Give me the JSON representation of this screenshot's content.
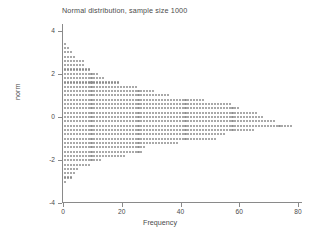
{
  "chart_data": {
    "type": "bar",
    "orientation": "horizontal",
    "style": "dot-plot",
    "title": "Normal distribution, sample size 1000",
    "xlabel": "Frequency",
    "ylabel": "norm",
    "xlim": [
      0,
      80
    ],
    "ylim": [
      -4,
      4
    ],
    "xticks": [
      0,
      20,
      40,
      60,
      80
    ],
    "xtick_labels": [
      "0",
      "20",
      "40",
      "60",
      "80"
    ],
    "yticks": [
      4,
      2,
      0,
      -2,
      -4
    ],
    "ytick_labels": [
      "4",
      "2",
      "0",
      "-2",
      "-4"
    ],
    "grid": false,
    "legend": false,
    "sample_size": 1000,
    "bin_width": 0.2,
    "dot_color": "#8c8c8c",
    "axis_color": "#8a8a8a",
    "text_color": "#4a4a4a",
    "background": "#ffffff",
    "categories": [
      3.4,
      3.2,
      3.0,
      2.8,
      2.6,
      2.4,
      2.2,
      2.0,
      1.8,
      1.6,
      1.4,
      1.2,
      1.0,
      0.8,
      0.6,
      0.4,
      0.2,
      0.0,
      -0.2,
      -0.4,
      -0.6,
      -0.8,
      -1.0,
      -1.2,
      -1.4,
      -1.6,
      -1.8,
      -2.0,
      -2.2,
      -2.4,
      -2.6,
      -2.8,
      -3.0
    ],
    "values": [
      1,
      2,
      3,
      4,
      7,
      7,
      9,
      12,
      14,
      19,
      25,
      31,
      36,
      48,
      57,
      60,
      66,
      68,
      72,
      78,
      65,
      55,
      52,
      39,
      28,
      27,
      21,
      13,
      9,
      5,
      4,
      3,
      1
    ]
  },
  "axis": {
    "x_title": "Frequency",
    "y_title": "norm"
  },
  "title": {
    "text": "Normal distribution, sample size 1000"
  }
}
